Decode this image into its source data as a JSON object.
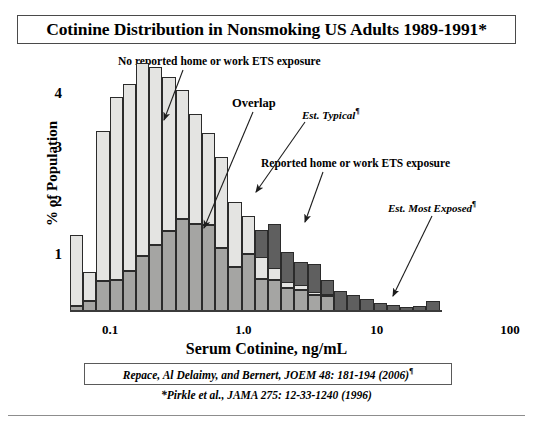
{
  "title": {
    "text": "Cotinine Distribution in Nonsmoking US Adults 1989-1991*"
  },
  "annotations": {
    "no_exposure": "No reported home or work ETS exposure",
    "overlap": "Overlap",
    "est_typical": "Est. Typical",
    "est_typical_mark": "¶",
    "reported": "Reported home or work ETS exposure",
    "est_most_exposed": "Est. Most Exposed",
    "est_most_exposed_mark": "¶"
  },
  "citation": {
    "primary": "Repace, Al Delaimy, and Bernert, JOEM 48: 181-194 (2006)",
    "primary_mark": "¶",
    "secondary": "*Pirkle et al., JAMA 275: 12-33-1240 (1996)"
  },
  "colors": {
    "no_exposure": "#e4e4e2",
    "overlap": "#a5a5a3",
    "reported": "#5f5f5f",
    "outline": "#2b2b2b",
    "axis": "#3b3b3b"
  },
  "chart_data": {
    "type": "bar",
    "title": "Cotinine Distribution in Nonsmoking US Adults 1989-1991*",
    "xlabel": "Serum Cotinine, ng/mL",
    "ylabel": "% of Population",
    "xscale": "log",
    "xlim": [
      0.05,
      100
    ],
    "ylim": [
      0,
      4
    ],
    "ytick_labels": [
      "1",
      "2",
      "3",
      "4"
    ],
    "ytick_values": [
      1,
      2,
      3,
      4
    ],
    "xtick_labels": [
      "0.1",
      "1.0",
      "10",
      "100"
    ],
    "xtick_values": [
      0.1,
      1.0,
      10,
      100
    ],
    "grid": false,
    "legend": "none",
    "stacked": true,
    "note": "Stacked histogram: light-gray segment = no reported ETS exposure, medium-gray segment = overlap of both populations, dark-gray segment = reported home or work ETS exposure.",
    "bin_centers": [
      0.062,
      0.075,
      0.09,
      0.108,
      0.13,
      0.157,
      0.19,
      0.228,
      0.275,
      0.331,
      0.4,
      0.48,
      0.58,
      0.7,
      0.84,
      1.01,
      1.22,
      1.47,
      1.77,
      2.13,
      2.57,
      3.09,
      3.73,
      4.49,
      5.41,
      6.51,
      7.84,
      9.44
    ],
    "series": [
      {
        "name": "No reported home or work ETS exposure",
        "color": "#e4e4e2",
        "values": [
          1.32,
          0.55,
          2.8,
          3.42,
          3.48,
          3.6,
          3.32,
          2.88,
          2.4,
          2.05,
          1.72,
          1.68,
          1.2,
          0.7,
          0.4,
          0.22,
          0.12,
          0.08,
          0.05,
          0.03,
          0.0,
          0.0,
          0.0,
          0.0,
          0.0,
          0.0,
          0.0,
          0.0
        ]
      },
      {
        "name": "Overlap",
        "color": "#a5a5a3",
        "values": [
          0.1,
          0.18,
          0.55,
          0.57,
          0.75,
          1.02,
          1.22,
          1.48,
          1.72,
          1.62,
          1.6,
          1.18,
          0.82,
          1.07,
          0.6,
          0.58,
          0.42,
          0.4,
          0.3,
          0.28,
          0.0,
          0.0,
          0.0,
          0.0,
          0.0,
          0.0,
          0.0,
          0.0
        ]
      },
      {
        "name": "Reported home or work ETS exposure",
        "color": "#5f5f5f",
        "values": [
          0.1,
          0.18,
          0.55,
          0.57,
          0.75,
          1.02,
          1.22,
          1.48,
          1.72,
          1.68,
          2.0,
          2.06,
          1.98,
          1.56,
          1.5,
          1.62,
          1.1,
          0.92,
          0.88,
          0.58,
          0.38,
          0.3,
          0.22,
          0.15,
          0.12,
          0.07,
          0.1,
          0.18
        ]
      }
    ],
    "bars": [
      {
        "x": 0.062,
        "light": 1.32,
        "overlap": 0.1,
        "dark": 0.1
      },
      {
        "x": 0.075,
        "light": 0.55,
        "overlap": 0.18,
        "dark": 0.18
      },
      {
        "x": 0.09,
        "light": 2.8,
        "overlap": 0.55,
        "dark": 0.55
      },
      {
        "x": 0.108,
        "light": 3.42,
        "overlap": 0.57,
        "dark": 0.57
      },
      {
        "x": 0.13,
        "light": 3.48,
        "overlap": 0.75,
        "dark": 0.75
      },
      {
        "x": 0.157,
        "light": 3.6,
        "overlap": 1.02,
        "dark": 1.02
      },
      {
        "x": 0.19,
        "light": 3.32,
        "overlap": 1.22,
        "dark": 1.22
      },
      {
        "x": 0.228,
        "light": 2.88,
        "overlap": 1.48,
        "dark": 1.48
      },
      {
        "x": 0.275,
        "light": 2.4,
        "overlap": 1.72,
        "dark": 1.72
      },
      {
        "x": 0.331,
        "light": 2.05,
        "overlap": 1.62,
        "dark": 1.68
      },
      {
        "x": 0.4,
        "light": 1.72,
        "overlap": 1.6,
        "dark": 2.0
      },
      {
        "x": 0.48,
        "light": 1.68,
        "overlap": 1.18,
        "dark": 2.06
      },
      {
        "x": 0.58,
        "light": 1.2,
        "overlap": 0.82,
        "dark": 1.98
      },
      {
        "x": 0.7,
        "light": 0.7,
        "overlap": 1.07,
        "dark": 1.56
      },
      {
        "x": 0.84,
        "light": 0.4,
        "overlap": 0.6,
        "dark": 1.5
      },
      {
        "x": 1.01,
        "light": 0.22,
        "overlap": 0.58,
        "dark": 1.62
      },
      {
        "x": 1.22,
        "light": 0.12,
        "overlap": 0.42,
        "dark": 1.1
      },
      {
        "x": 1.47,
        "light": 0.08,
        "overlap": 0.4,
        "dark": 0.92
      },
      {
        "x": 1.77,
        "light": 0.05,
        "overlap": 0.3,
        "dark": 0.88
      },
      {
        "x": 2.13,
        "light": 0.03,
        "overlap": 0.28,
        "dark": 0.58
      },
      {
        "x": 2.57,
        "light": 0.0,
        "overlap": 0.0,
        "dark": 0.38
      },
      {
        "x": 3.09,
        "light": 0.0,
        "overlap": 0.0,
        "dark": 0.3
      },
      {
        "x": 3.73,
        "light": 0.0,
        "overlap": 0.0,
        "dark": 0.22
      },
      {
        "x": 4.49,
        "light": 0.0,
        "overlap": 0.0,
        "dark": 0.15
      },
      {
        "x": 5.41,
        "light": 0.0,
        "overlap": 0.0,
        "dark": 0.12
      },
      {
        "x": 6.51,
        "light": 0.0,
        "overlap": 0.0,
        "dark": 0.07
      },
      {
        "x": 7.84,
        "light": 0.0,
        "overlap": 0.0,
        "dark": 0.1
      },
      {
        "x": 9.44,
        "light": 0.0,
        "overlap": 0.0,
        "dark": 0.18
      }
    ]
  }
}
